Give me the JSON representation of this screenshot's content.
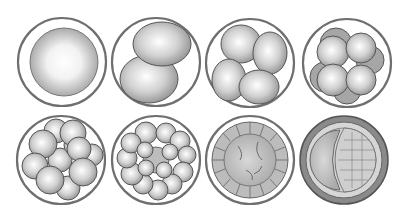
{
  "figure": {
    "background": "#ffffff",
    "membrane_color": "#777777",
    "cell_fill_light": "#ffffff",
    "cell_fill_dark": "#9a9a9a",
    "stages": [
      {
        "name": "zygote",
        "cells": 1,
        "row": 1,
        "col": 1
      },
      {
        "name": "2-cell",
        "cells": 2,
        "row": 1,
        "col": 2
      },
      {
        "name": "4-cell",
        "cells": 4,
        "row": 1,
        "col": 3
      },
      {
        "name": "8-cell",
        "cells": 8,
        "row": 1,
        "col": 4
      },
      {
        "name": "16-cell morula",
        "cells": 16,
        "row": 2,
        "col": 1
      },
      {
        "name": "32-cell morula",
        "cells": 32,
        "row": 2,
        "col": 2
      },
      {
        "name": "early blastula",
        "cells": 0,
        "row": 2,
        "col": 3
      },
      {
        "name": "blastocyst",
        "cells": 0,
        "row": 2,
        "col": 4
      }
    ]
  }
}
